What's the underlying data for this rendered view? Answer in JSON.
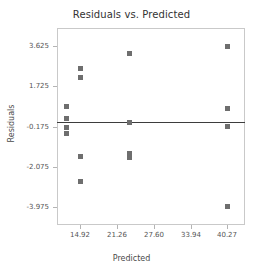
{
  "chart_data": {
    "type": "scatter",
    "title": "Residuals vs. Predicted",
    "xlabel": "Predicted",
    "ylabel": "Residuals",
    "xlim": [
      11.0,
      43.3
    ],
    "ylim": [
      -4.85,
      4.5
    ],
    "grid": false,
    "legend": null,
    "xticks": [
      "14.92",
      "21.26",
      "27.60",
      "33.94",
      "40.27"
    ],
    "xtick_values": [
      14.92,
      21.26,
      27.6,
      33.94,
      40.27
    ],
    "yticks": [
      "3.625",
      "1.725",
      "-0.175",
      "-2.075",
      "-3.975"
    ],
    "ytick_values": [
      3.625,
      1.725,
      -0.175,
      -2.075,
      -3.975
    ],
    "reference_line": {
      "orientation": "horizontal",
      "y": 0.05,
      "color": "#3d3d3d"
    },
    "marker_color": "#6e6e6e",
    "points": [
      {
        "x": 12.5,
        "y": 0.76
      },
      {
        "x": 12.5,
        "y": 0.21
      },
      {
        "x": 12.5,
        "y": -0.2
      },
      {
        "x": 12.5,
        "y": -0.53
      },
      {
        "x": 14.92,
        "y": 2.56
      },
      {
        "x": 14.92,
        "y": 2.16
      },
      {
        "x": 14.92,
        "y": -1.6
      },
      {
        "x": 14.92,
        "y": -2.78
      },
      {
        "x": 23.3,
        "y": 3.27
      },
      {
        "x": 23.3,
        "y": 0.03
      },
      {
        "x": 23.3,
        "y": -1.55,
        "overlapping": 2
      },
      {
        "x": 40.27,
        "y": 3.63
      },
      {
        "x": 40.27,
        "y": 0.68
      },
      {
        "x": 40.27,
        "y": -0.18
      },
      {
        "x": 40.27,
        "y": -3.98
      }
    ]
  }
}
